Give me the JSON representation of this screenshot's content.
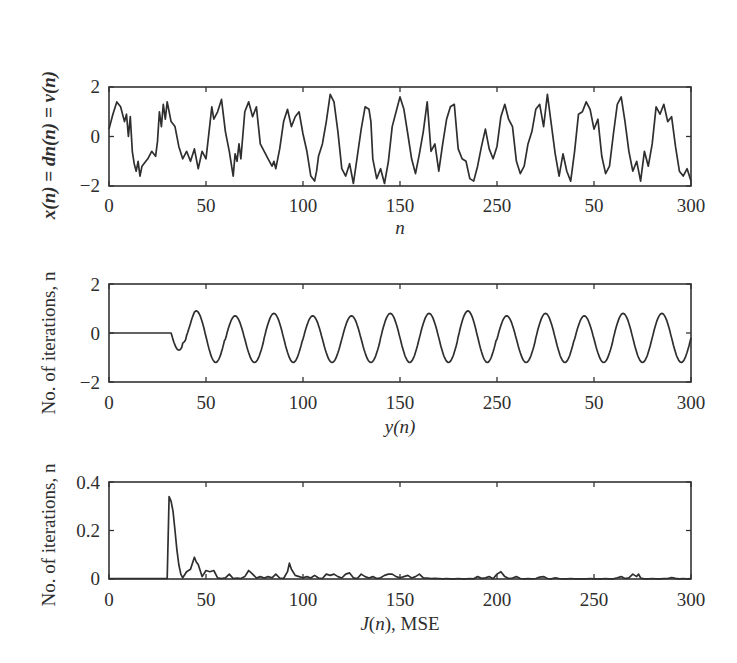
{
  "chart_data": [
    {
      "type": "line",
      "panel": "top",
      "title": "",
      "xlabel": "n",
      "ylabel": "x(n) = dn(n) = v(n)",
      "xlim": [
        0,
        300
      ],
      "ylim": [
        -2,
        2
      ],
      "x_ticks": [
        0,
        50,
        100,
        150,
        200,
        250,
        300
      ],
      "x_tick_labels": [
        "0",
        "50",
        "100",
        "150",
        "250",
        "50",
        "300"
      ],
      "y_ticks": [
        -2,
        0,
        2
      ],
      "y_tick_labels": [
        "−2",
        "0",
        "2"
      ],
      "series": [
        {
          "name": "x(n)",
          "x": [
            0,
            2,
            4,
            6,
            8,
            9,
            10,
            11,
            12,
            13,
            14,
            15,
            16,
            17,
            18,
            20,
            22,
            24,
            25,
            26,
            27,
            28,
            29,
            30,
            32,
            34,
            36,
            38,
            40,
            42,
            44,
            46,
            48,
            50,
            52,
            53,
            54,
            56,
            58,
            60,
            62,
            64,
            65,
            66,
            67,
            68,
            70,
            72,
            74,
            76,
            78,
            80,
            82,
            84,
            85,
            86,
            88,
            90,
            92,
            94,
            96,
            98,
            100,
            102,
            104,
            106,
            107,
            108,
            110,
            112,
            114,
            116,
            118,
            120,
            122,
            124,
            126,
            128,
            130,
            132,
            134,
            135,
            136,
            138,
            140,
            142,
            144,
            146,
            148,
            150,
            152,
            154,
            156,
            158,
            160,
            162,
            164,
            166,
            168,
            170,
            172,
            174,
            176,
            178,
            180,
            182,
            184,
            186,
            188,
            190,
            192,
            194,
            196,
            198,
            200,
            202,
            204,
            206,
            208,
            210,
            212,
            214,
            216,
            218,
            220,
            222,
            224,
            226,
            228,
            230,
            232,
            234,
            236,
            238,
            240,
            242,
            244,
            246,
            248,
            250,
            252,
            254,
            256,
            258,
            260,
            262,
            264,
            266,
            268,
            270,
            272,
            274,
            276,
            278,
            280,
            282,
            284,
            286,
            288,
            290,
            292,
            294,
            296,
            298,
            300
          ],
          "values": [
            0.3,
            0.9,
            1.4,
            1.2,
            0.6,
            0.9,
            0.0,
            0.8,
            -0.6,
            -1.1,
            -1.4,
            -1.0,
            -1.6,
            -1.2,
            -1.1,
            -0.9,
            -0.6,
            -0.8,
            -0.2,
            1.0,
            0.4,
            1.3,
            0.7,
            1.4,
            0.6,
            0.4,
            -0.4,
            -0.9,
            -0.6,
            -1.0,
            -0.5,
            -1.3,
            -0.6,
            -0.9,
            0.5,
            1.2,
            0.7,
            1.0,
            1.5,
            0.2,
            -0.6,
            -1.6,
            -0.7,
            -1.0,
            -0.3,
            -0.9,
            1.0,
            1.4,
            0.8,
            1.2,
            -0.3,
            -0.6,
            -0.9,
            -1.2,
            -1.0,
            -1.3,
            -0.5,
            0.6,
            1.1,
            0.4,
            0.8,
            1.0,
            0.1,
            -0.6,
            -1.6,
            -1.8,
            -1.4,
            -0.8,
            -0.3,
            0.6,
            1.7,
            1.4,
            0.2,
            -1.3,
            -1.6,
            -1.1,
            -1.9,
            -0.8,
            0.3,
            1.2,
            1.1,
            0.6,
            -0.9,
            -1.7,
            -1.3,
            -1.9,
            -1.0,
            0.4,
            1.0,
            1.6,
            1.1,
            0.1,
            -0.9,
            -1.5,
            -0.7,
            0.2,
            1.4,
            -0.6,
            -0.3,
            -1.4,
            -0.3,
            0.7,
            1.2,
            1.3,
            -0.5,
            -0.9,
            -1.0,
            -1.7,
            -1.8,
            -1.2,
            -0.4,
            0.3,
            -0.5,
            -0.9,
            -0.4,
            0.8,
            1.3,
            0.7,
            0.4,
            -1.0,
            -1.5,
            -1.2,
            -0.3,
            0.2,
            1.1,
            1.3,
            0.4,
            1.7,
            0.5,
            -0.7,
            -1.6,
            -0.7,
            -1.4,
            -1.8,
            -0.6,
            0.9,
            1.0,
            1.4,
            1.1,
            0.3,
            0.7,
            -0.8,
            -1.5,
            -1.2,
            0.1,
            1.3,
            1.6,
            0.6,
            -0.6,
            -1.4,
            -1.0,
            -1.8,
            -0.6,
            -1.2,
            -0.3,
            1.2,
            0.9,
            1.3,
            0.6,
            0.8,
            -0.4,
            -1.4,
            -1.6,
            -1.3,
            -1.8,
            -0.3,
            -0.3
          ]
        }
      ]
    },
    {
      "type": "line",
      "panel": "middle",
      "title": "",
      "xlabel": "y(n)",
      "ylabel": "No. of iterations, n",
      "xlim": [
        0,
        300
      ],
      "ylim": [
        -2,
        2
      ],
      "x_ticks": [
        0,
        50,
        100,
        150,
        200,
        250,
        300
      ],
      "x_tick_labels": [
        "0",
        "50",
        "100",
        "150",
        "250",
        "50",
        "300"
      ],
      "y_ticks": [
        -2,
        0,
        2
      ],
      "y_tick_labels": [
        "−2",
        "0",
        "2"
      ],
      "series": [
        {
          "name": "y(n)",
          "description": "zero until n≈32, then sinusoid with period ≈20 samples, amplitude ≈1.0 centered near −0.2",
          "onset_n": 32,
          "period": 20,
          "amplitude": 1.0,
          "offset": -0.2,
          "peak_values": [
            0.6,
            0.9,
            0.7,
            0.8,
            0.7,
            0.7,
            0.8,
            0.8,
            0.9,
            0.7,
            0.8,
            0.7,
            0.8
          ],
          "first_dip": -0.7
        }
      ]
    },
    {
      "type": "line",
      "panel": "bottom",
      "title": "",
      "xlabel": "J(n), MSE",
      "ylabel": "No. of iterations, n",
      "xlim": [
        0,
        300
      ],
      "ylim": [
        0,
        0.4
      ],
      "x_ticks": [
        0,
        50,
        100,
        150,
        200,
        250,
        300
      ],
      "x_tick_labels": [
        "0",
        "50",
        "100",
        "150",
        "200",
        "250",
        "300"
      ],
      "y_ticks": [
        0,
        0.2,
        0.4
      ],
      "y_tick_labels": [
        "0",
        "0.2",
        "0.4"
      ],
      "series": [
        {
          "name": "J(n)",
          "x": [
            0,
            30,
            31,
            32,
            33,
            34,
            35,
            36,
            37,
            38,
            40,
            42,
            44,
            45,
            46,
            48,
            50,
            52,
            54,
            56,
            58,
            60,
            62,
            64,
            66,
            68,
            70,
            72,
            74,
            76,
            78,
            80,
            82,
            84,
            86,
            88,
            90,
            92,
            93,
            94,
            96,
            98,
            100,
            102,
            104,
            106,
            108,
            110,
            112,
            114,
            116,
            118,
            120,
            122,
            124,
            126,
            128,
            130,
            132,
            134,
            136,
            138,
            140,
            142,
            144,
            146,
            148,
            150,
            152,
            154,
            156,
            158,
            160,
            162,
            164,
            166,
            168,
            170,
            172,
            174,
            176,
            178,
            180,
            182,
            184,
            186,
            188,
            190,
            192,
            194,
            196,
            198,
            200,
            202,
            204,
            206,
            208,
            210,
            212,
            214,
            216,
            218,
            220,
            222,
            224,
            226,
            228,
            230,
            232,
            234,
            236,
            238,
            240,
            242,
            244,
            246,
            248,
            250,
            252,
            254,
            256,
            258,
            260,
            262,
            264,
            266,
            268,
            270,
            272,
            273,
            274,
            276,
            278,
            280,
            282,
            284,
            286,
            288,
            290,
            292,
            294,
            296,
            298,
            300
          ],
          "values": [
            0.002,
            0.002,
            0.34,
            0.32,
            0.28,
            0.2,
            0.12,
            0.06,
            0.02,
            0.005,
            0.03,
            0.04,
            0.09,
            0.07,
            0.06,
            0.01,
            0.035,
            0.03,
            0.035,
            0.005,
            0.002,
            0.005,
            0.02,
            0.002,
            0.004,
            0.002,
            0.01,
            0.035,
            0.02,
            0.004,
            0.01,
            0.004,
            0.01,
            0.005,
            0.02,
            0.004,
            0.002,
            0.03,
            0.065,
            0.04,
            0.015,
            0.01,
            0.005,
            0.01,
            0.004,
            0.015,
            0.004,
            0.002,
            0.02,
            0.015,
            0.02,
            0.01,
            0.004,
            0.02,
            0.025,
            0.005,
            0.002,
            0.02,
            0.01,
            0.004,
            0.01,
            0.002,
            0.005,
            0.015,
            0.02,
            0.02,
            0.01,
            0.005,
            0.01,
            0.015,
            0.004,
            0.01,
            0.02,
            0.005,
            0.004,
            0.002,
            0.003,
            0.002,
            0.001,
            0.002,
            0.001,
            0.001,
            0.002,
            0.001,
            0.001,
            0.002,
            0.001,
            0.01,
            0.003,
            0.005,
            0.01,
            0.001,
            0.02,
            0.03,
            0.01,
            0.002,
            0.004,
            0.01,
            0.002,
            0.001,
            0.002,
            0.001,
            0.002,
            0.008,
            0.01,
            0.002,
            0.001,
            0.005,
            0.002,
            0.001,
            0.001,
            0.002,
            0.001,
            0.001,
            0.001,
            0.001,
            0.002,
            0.001,
            0.001,
            0.001,
            0.002,
            0.001,
            0.001,
            0.005,
            0.01,
            0.002,
            0.005,
            0.02,
            0.01,
            0.02,
            0.004,
            0.001,
            0.001,
            0.002,
            0.001,
            0.001,
            0.002,
            0.002,
            0.006,
            0.003,
            0.001,
            0.002,
            0.001,
            0.002
          ]
        }
      ]
    }
  ],
  "panels": {
    "top": {
      "ylabel": "x(n) = dn(n) = v(n)",
      "xlabel": "n",
      "x_tick_labels": [
        "0",
        "50",
        "100",
        "150",
        "250",
        "50",
        "300"
      ],
      "y_tick_labels": [
        "−2",
        "0",
        "2"
      ]
    },
    "middle": {
      "ylabel": "No. of iterations, n",
      "xlabel": "y(n)",
      "x_tick_labels": [
        "0",
        "50",
        "100",
        "150",
        "250",
        "50",
        "300"
      ],
      "y_tick_labels": [
        "−2",
        "0",
        "2"
      ]
    },
    "bottom": {
      "ylabel": "No. of iterations, n",
      "xlabel": "J(n), MSE",
      "x_tick_labels": [
        "0",
        "50",
        "100",
        "150",
        "200",
        "250",
        "300"
      ],
      "y_tick_labels": [
        "0",
        "0.2",
        "0.4"
      ]
    }
  },
  "colors": {
    "line": "#2f2f2f",
    "frame": "#333333",
    "background": "#ffffff"
  }
}
